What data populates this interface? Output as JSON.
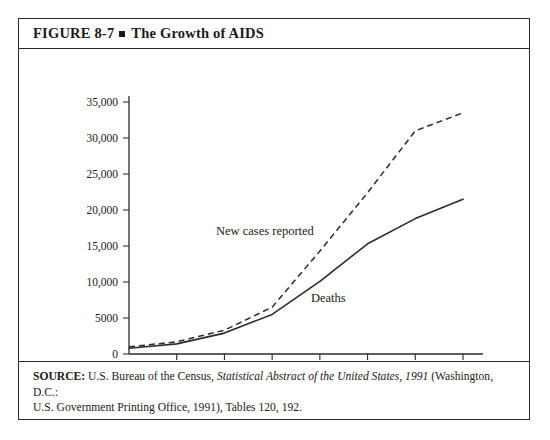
{
  "figure": {
    "number": "FIGURE 8-7",
    "bullet": "square-bullet",
    "title": "The Growth of AIDS"
  },
  "source": {
    "label": "SOURCE:",
    "part1": " U.S. Bureau of the Census, ",
    "italic": "Statistical Abstract of the United States, 1991",
    "part2": " (Washington, D.C.:",
    "line2": "U.S. Government Printing Office, 1991), Tables 120, 192."
  },
  "annotations": {
    "new_cases": "New cases reported",
    "deaths": "Deaths"
  },
  "chart_data": {
    "type": "line",
    "title": "The Growth of AIDS",
    "xlabel": "",
    "ylabel": "",
    "categories": [
      "1982",
      "1983",
      "1984",
      "1985",
      "1986",
      "1987",
      "1988",
      "1989"
    ],
    "x": [
      1982,
      1983,
      1984,
      1985,
      1986,
      1987,
      1988,
      1989
    ],
    "xlim": [
      1982,
      1989
    ],
    "ylim": [
      0,
      35000
    ],
    "ytick_values": [
      0,
      5000,
      10000,
      15000,
      20000,
      25000,
      30000,
      35000
    ],
    "ytick_labels": [
      "0",
      "5000",
      "10,000",
      "15,000",
      "20,000",
      "25,000",
      "30,000",
      "35,000"
    ],
    "xtick_labels": [
      "1982",
      "1983",
      "1984",
      "1985",
      "1986",
      "1987",
      "1988",
      "1989"
    ],
    "grid": false,
    "legend": "inline-annotations",
    "series": [
      {
        "name": "New cases reported",
        "style": "dashed",
        "values": [
          1000,
          1700,
          3300,
          6500,
          14300,
          22400,
          31000,
          33500
        ]
      },
      {
        "name": "Deaths",
        "style": "solid",
        "values": [
          800,
          1400,
          2900,
          5500,
          10100,
          15300,
          18800,
          21500
        ]
      }
    ],
    "colors": {
      "line": "#2b2b2b",
      "axis": "#2b2b2b",
      "background": "#ffffff"
    }
  }
}
